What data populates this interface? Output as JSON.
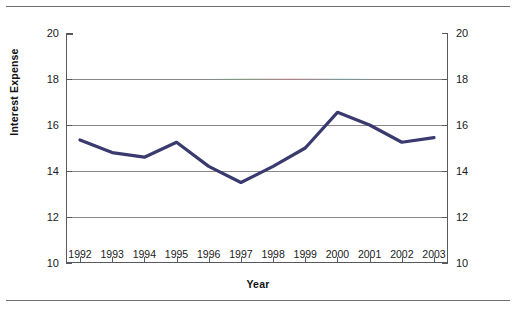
{
  "figure": {
    "background_color": "#ffffff",
    "rules_color": "#6f6f6f"
  },
  "chart_data": {
    "type": "line",
    "title": "",
    "xlabel": "Year",
    "ylabel": "Interest Expense",
    "categories": [
      "1992",
      "1993",
      "1994",
      "1995",
      "1996",
      "1997",
      "1998",
      "1999",
      "2000",
      "2001",
      "2002",
      "2003"
    ],
    "x": [
      1992,
      1993,
      1994,
      1995,
      1996,
      1997,
      1998,
      1999,
      2000,
      2001,
      2002,
      2003
    ],
    "values": [
      15.35,
      14.8,
      14.6,
      15.25,
      14.2,
      13.5,
      14.2,
      15.0,
      16.55,
      16.0,
      15.25,
      15.45
    ],
    "series": [
      {
        "name": "Interest Expense",
        "color": "#3a3a6e",
        "line_width": 3.2,
        "values": [
          15.35,
          14.8,
          14.6,
          15.25,
          14.2,
          13.5,
          14.2,
          15.0,
          16.55,
          16.0,
          15.25,
          15.45
        ]
      }
    ],
    "ylim": [
      10,
      20
    ],
    "yticks": [
      10,
      12,
      14,
      16,
      18,
      20
    ],
    "ytick_labels": [
      "10",
      "12",
      "14",
      "16",
      "18",
      "20"
    ],
    "y_axis_right_mirrored": true,
    "ytick_labels_right": [
      "10",
      "12",
      "14",
      "16",
      "18",
      "20"
    ],
    "gridlines": [
      12,
      14,
      16,
      18
    ],
    "grid": true,
    "grid_color": "#878787",
    "axis_color": "#58585f",
    "legend": null,
    "legend_position": "none",
    "annotations": []
  }
}
